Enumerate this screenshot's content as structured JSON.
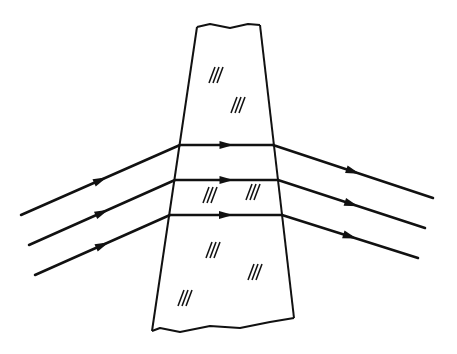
{
  "diagram": {
    "type": "refraction-through-glass-slab",
    "stroke_color": "#111111",
    "background": "#ffffff",
    "slab": {
      "top_edge": [
        [
          197,
          27
        ],
        [
          210,
          24
        ],
        [
          230,
          28
        ],
        [
          248,
          24
        ],
        [
          260,
          25
        ]
      ],
      "right_edge": [
        [
          260,
          25
        ],
        [
          294,
          318
        ]
      ],
      "bottom_edge": [
        [
          294,
          318
        ],
        [
          270,
          322
        ],
        [
          240,
          328
        ],
        [
          210,
          326
        ],
        [
          180,
          332
        ],
        [
          160,
          328
        ],
        [
          152,
          331
        ]
      ],
      "left_edge": [
        [
          152,
          331
        ],
        [
          197,
          27
        ]
      ],
      "hatch_marks": [
        {
          "x": 216,
          "y": 75
        },
        {
          "x": 238,
          "y": 105
        },
        {
          "x": 210,
          "y": 195
        },
        {
          "x": 253,
          "y": 192
        },
        {
          "x": 213,
          "y": 250
        },
        {
          "x": 255,
          "y": 272
        },
        {
          "x": 185,
          "y": 298
        }
      ]
    },
    "rays": [
      {
        "incident": [
          [
            21,
            215
          ],
          [
            180,
            145
          ]
        ],
        "inside": [
          [
            180,
            145
          ],
          [
            273,
            145
          ]
        ],
        "emergent": [
          [
            273,
            145
          ],
          [
            433,
            198
          ]
        ]
      },
      {
        "incident": [
          [
            29,
            245
          ],
          [
            175,
            180
          ]
        ],
        "inside": [
          [
            175,
            180
          ],
          [
            278,
            180
          ]
        ],
        "emergent": [
          [
            278,
            180
          ],
          [
            425,
            228
          ]
        ]
      },
      {
        "incident": [
          [
            35,
            275
          ],
          [
            170,
            215
          ]
        ],
        "inside": [
          [
            170,
            215
          ],
          [
            282,
            215
          ]
        ],
        "emergent": [
          [
            282,
            215
          ],
          [
            418,
            258
          ]
        ]
      }
    ]
  }
}
